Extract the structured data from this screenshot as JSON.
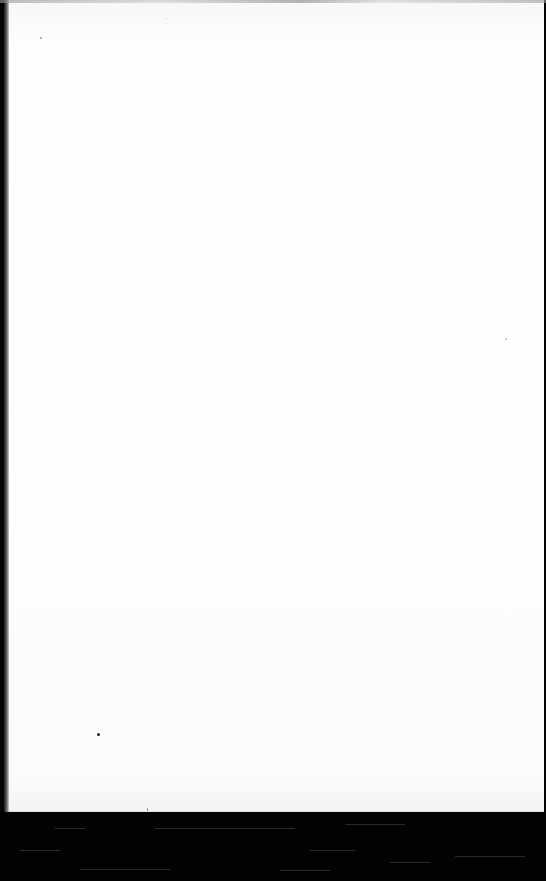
{
  "document": {
    "type": "scanned-page",
    "content_visible": false,
    "page_color": "#fdfdfd",
    "border_color": "#050505"
  }
}
